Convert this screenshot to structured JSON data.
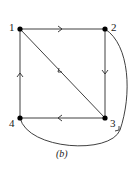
{
  "diagram": {
    "type": "directed graph",
    "caption": "(b)",
    "nodes": [
      {
        "id": "1",
        "label": "1",
        "x": 20,
        "y": 29
      },
      {
        "id": "2",
        "label": "2",
        "x": 105,
        "y": 29
      },
      {
        "id": "3",
        "label": "3",
        "x": 105,
        "y": 118
      },
      {
        "id": "4",
        "label": "4",
        "x": 20,
        "y": 118
      }
    ],
    "edges": [
      {
        "from": "1",
        "to": "2"
      },
      {
        "from": "2",
        "to": "3"
      },
      {
        "from": "3",
        "to": "4"
      },
      {
        "from": "4",
        "to": "1"
      },
      {
        "from": "3",
        "to": "1"
      },
      {
        "from": "4",
        "to": "2",
        "curved": true
      }
    ],
    "colors": {
      "stroke": "#2a2a2a",
      "node": "#000000"
    }
  }
}
